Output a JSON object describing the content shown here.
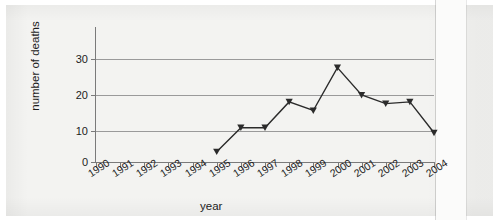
{
  "chart_data": {
    "type": "line",
    "title": "",
    "xlabel": "year",
    "ylabel": "number of deaths",
    "categories": [
      "1990",
      "1991",
      "1992",
      "1993",
      "1994",
      "1995",
      "1996",
      "1997",
      "1998",
      "1999",
      "2000",
      "2001",
      "2002",
      "2003",
      "2004"
    ],
    "values": [
      null,
      null,
      null,
      null,
      null,
      3,
      10,
      10,
      17.5,
      15,
      27.5,
      19.5,
      17,
      17.5,
      8.5
    ],
    "series": [
      {
        "name": "number of deaths",
        "points": [
          {
            "x": "1995",
            "y": 3
          },
          {
            "x": "1996",
            "y": 10
          },
          {
            "x": "1997",
            "y": 10
          },
          {
            "x": "1998",
            "y": 17.5
          },
          {
            "x": "1999",
            "y": 15
          },
          {
            "x": "2000",
            "y": 27.5
          },
          {
            "x": "2001",
            "y": 19.5
          },
          {
            "x": "2002",
            "y": 17
          },
          {
            "x": "2003",
            "y": 17.5
          },
          {
            "x": "2004",
            "y": 8.5
          }
        ]
      }
    ],
    "ylim": [
      0,
      37
    ],
    "yticks": [
      0,
      10,
      20,
      30
    ],
    "ytick_labels": [
      "0",
      "10",
      "20",
      "30"
    ],
    "xlim": [
      "1990",
      "2004"
    ],
    "grid": "horizontal",
    "legend": "none",
    "marker": "triangle-down",
    "line_color": "#2b2b2b",
    "marker_color": "#2b2b2b",
    "grid_color": "#9a9a9a",
    "axis_color": "#7a7a7a",
    "background_color": "#f3f3f1",
    "text_color": "#1c1c1c"
  }
}
